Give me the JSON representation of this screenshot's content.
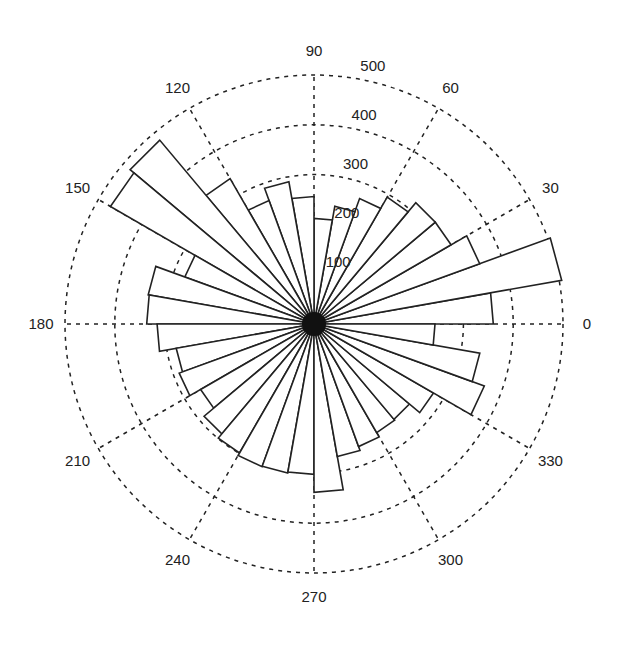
{
  "chart_data": {
    "type": "polar-rose",
    "title": "",
    "bin_width_deg": 10,
    "bin_edges_deg": [
      0,
      10,
      20,
      30,
      40,
      50,
      60,
      70,
      80,
      90,
      100,
      110,
      120,
      130,
      140,
      150,
      160,
      170,
      180,
      190,
      200,
      210,
      220,
      230,
      240,
      250,
      260,
      270,
      280,
      290,
      300,
      310,
      320,
      330,
      340,
      350,
      360
    ],
    "categories": [
      "0-10",
      "10-20",
      "20-30",
      "30-40",
      "40-50",
      "50-60",
      "60-70",
      "70-80",
      "80-90",
      "90-100",
      "100-110",
      "110-120",
      "120-130",
      "130-140",
      "140-150",
      "150-160",
      "160-170",
      "170-180",
      "180-190",
      "190-200",
      "200-210",
      "210-220",
      "220-230",
      "230-240",
      "240-250",
      "250-260",
      "260-270",
      "270-280",
      "280-290",
      "290-300",
      "300-310",
      "310-320",
      "320-330",
      "330-340",
      "340-350",
      "350-360"
    ],
    "values": [
      360,
      505,
      354,
      318,
      318,
      294,
      268,
      240,
      212,
      256,
      290,
      264,
      337,
      482,
      472,
      276,
      338,
      336,
      315,
      281,
      288,
      263,
      288,
      299,
      305,
      304,
      302,
      338,
      270,
      262,
      252,
      250,
      277,
      364,
      338,
      243
    ],
    "radial_ticks": [
      100,
      200,
      300,
      400,
      500
    ],
    "radial_tick_labels": [
      "100",
      "200",
      "300",
      "400",
      "500"
    ],
    "rlim": [
      0,
      500
    ],
    "angle_ticks_deg": [
      0,
      30,
      60,
      90,
      120,
      150,
      180,
      210,
      240,
      270,
      300,
      330
    ],
    "angle_tick_labels": [
      "0",
      "30",
      "60",
      "90",
      "120",
      "150",
      "180",
      "210",
      "240",
      "270",
      "300",
      "330"
    ],
    "grid": true,
    "grid_style": "dotted",
    "radial_label_angle_deg": 80
  },
  "colors": {
    "line": "#222222",
    "bar_fill": "#ffffff",
    "background": "#ffffff"
  }
}
